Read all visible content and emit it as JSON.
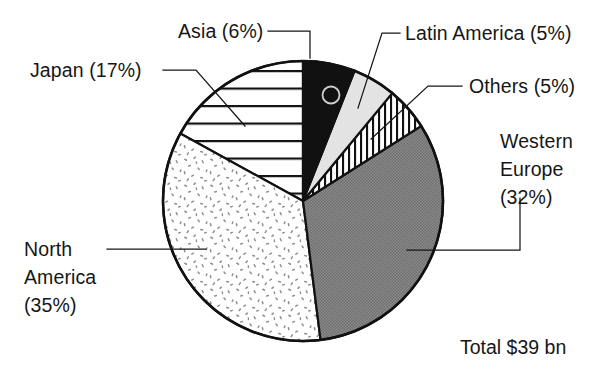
{
  "chart_data": {
    "type": "pie",
    "title": "",
    "subtitle": "",
    "xlabel": "",
    "ylabel": "",
    "legend_position": "callout-labels",
    "grid": false,
    "total_label": "Total $39 bn",
    "total_value": 39,
    "total_units": "bn",
    "total_currency": "$",
    "start_angle_deg": 0,
    "direction": "clockwise",
    "categories": [
      "Asia",
      "Latin America",
      "Others",
      "Western Europe",
      "North America",
      "Japan"
    ],
    "values": [
      6,
      5,
      5,
      32,
      35,
      17
    ],
    "value_units": "percent",
    "slices": [
      {
        "name": "Asia",
        "value": 6,
        "label": "Asia (6%)",
        "fill_style": "solid-black",
        "fill_color": "#111111",
        "start_deg": 0,
        "end_deg": 21.6
      },
      {
        "name": "Latin America",
        "value": 5,
        "label": "Latin America (5%)",
        "fill_style": "light-gray",
        "fill_color": "#e3e3e3",
        "start_deg": 21.6,
        "end_deg": 39.6
      },
      {
        "name": "Others",
        "value": 5,
        "label": "Others (5%)",
        "fill_style": "vertical-hatch",
        "fill_color": "#ffffff",
        "start_deg": 39.6,
        "end_deg": 57.6
      },
      {
        "name": "Western Europe",
        "value": 32,
        "label": "Western Europe (32%)",
        "label_lines": [
          "Western",
          "Europe",
          "(32%)"
        ],
        "fill_style": "medium-gray",
        "fill_color": "#808080",
        "start_deg": 57.6,
        "end_deg": 172.8
      },
      {
        "name": "North America",
        "value": 35,
        "label": "North America (35%)",
        "label_lines": [
          "North",
          "America",
          "(35%)"
        ],
        "fill_style": "stipple-speckle",
        "fill_color": "#ffffff",
        "start_deg": 172.8,
        "end_deg": 298.8
      },
      {
        "name": "Japan",
        "value": 17,
        "label": "Japan (17%)",
        "fill_style": "horizontal-lines",
        "fill_color": "#ffffff",
        "start_deg": 298.8,
        "end_deg": 360
      }
    ]
  },
  "labels": {
    "asia": "Asia (6%)",
    "japan": "Japan (17%)",
    "latin_america": "Latin America (5%)",
    "others": "Others (5%)",
    "western_europe_line1": "Western",
    "western_europe_line2": "Europe",
    "western_europe_line3": "(32%)",
    "north_america_line1": "North",
    "north_america_line2": "America",
    "north_america_line3": "(35%)",
    "total": "Total $39 bn"
  },
  "colors": {
    "ink": "#161616",
    "outline": "#111111",
    "asia_fill": "#111111",
    "latin_america_fill": "#e3e3e3",
    "western_europe_fill": "#808080",
    "background": "#ffffff"
  }
}
